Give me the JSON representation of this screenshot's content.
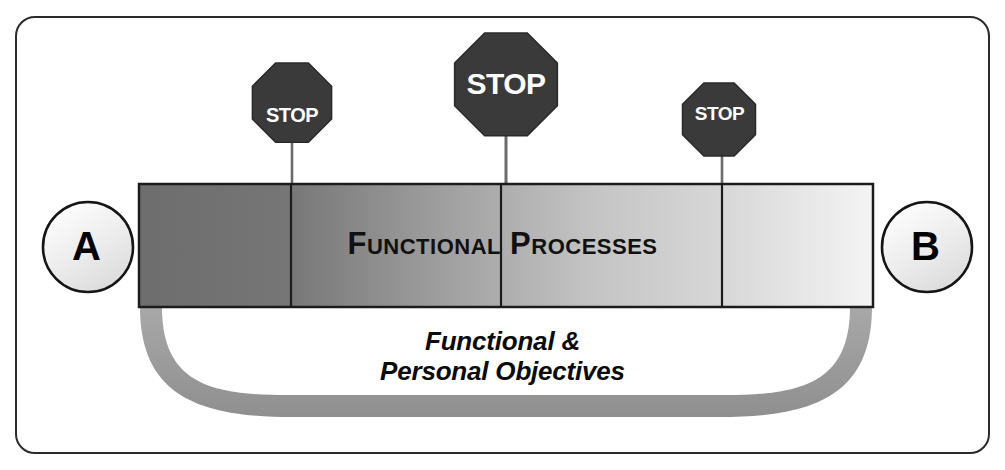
{
  "diagram": {
    "title_text": "Functional Processes",
    "frame": {
      "name": "outer-border",
      "color": "#2b2b2b"
    },
    "bar": {
      "caption": "Functional Processes",
      "segments": 4,
      "gradient_from": "#6f6f6f",
      "gradient_to": "#f2f2f2",
      "border_color": "#1a1a1a"
    },
    "nodes": [
      {
        "id": "a",
        "label": "A"
      },
      {
        "id": "b",
        "label": "B"
      }
    ],
    "stop_signs": [
      {
        "id": "stop-1",
        "label": "STOP",
        "size": "small",
        "color": "#3b3b3b"
      },
      {
        "id": "stop-2",
        "label": "STOP",
        "size": "large",
        "color": "#3b3b3b"
      },
      {
        "id": "stop-3",
        "label": "STOP",
        "size": "small",
        "color": "#3b3b3b"
      }
    ],
    "arc": {
      "line1": "Functional &",
      "line2": "Personal Objectives",
      "color": "#9a9a9a"
    }
  }
}
